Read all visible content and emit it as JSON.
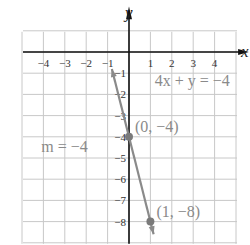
{
  "chart_data": {
    "type": "line",
    "title": "",
    "xlabel": "x",
    "ylabel": "y",
    "xlim": [
      -5,
      5
    ],
    "ylim": [
      -9,
      1
    ],
    "grid": true,
    "x_ticks": [
      -4,
      -3,
      -2,
      -1,
      1,
      2,
      3,
      4
    ],
    "x_tick_labels": [
      "−4",
      "−3",
      "−2",
      "−1",
      "1",
      "2",
      "3",
      "4"
    ],
    "y_ticks": [
      -1,
      -2,
      -3,
      -4,
      -5,
      -6,
      -7,
      -8
    ],
    "y_tick_labels": [
      "−1",
      "−2",
      "−3",
      "−4",
      "−5",
      "−6",
      "−7",
      "−8"
    ],
    "series": [
      {
        "name": "4x + y = −4",
        "equation": "4x + y = −4",
        "slope": -4,
        "intercept": -4,
        "x": [
          -0.8,
          1.15
        ],
        "y": [
          -0.8,
          -8.6
        ],
        "color": "#8a8a8a"
      }
    ],
    "points": [
      {
        "x": 0,
        "y": -4,
        "label": "(0, −4)"
      },
      {
        "x": 1,
        "y": -8,
        "label": "(1, −8)"
      }
    ],
    "annotations": [
      {
        "text": "4x + y = −4",
        "x": 1.2,
        "y": -1.6
      },
      {
        "text": "m = −4",
        "x": -4.1,
        "y": -4.7
      }
    ]
  },
  "labels": {
    "x_axis": "x",
    "y_axis": "y",
    "equation": "4x + y = −4",
    "slope": "m = −4",
    "point1": "(0, −4)",
    "point2": "(1, −8)"
  }
}
